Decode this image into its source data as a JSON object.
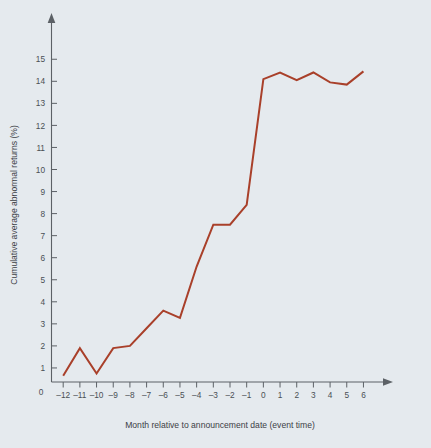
{
  "chart_data": {
    "type": "line",
    "title": "",
    "subtitle": "",
    "xlabel": "Month relative to announcement date (event time)",
    "ylabel": "Cumulative average abnormal returns (%)",
    "x": [
      -12,
      -11,
      -10,
      -9,
      -8,
      -7,
      -6,
      -5,
      -4,
      -3,
      -2,
      -1,
      0,
      1,
      2,
      3,
      4,
      5,
      6
    ],
    "values": [
      0.65,
      1.9,
      0.75,
      1.9,
      2.0,
      2.8,
      3.6,
      3.27,
      5.6,
      7.5,
      7.5,
      8.4,
      14.1,
      14.4,
      14.05,
      14.4,
      13.95,
      13.85,
      14.45
    ],
    "series": [
      {
        "name": "Cumulative average abnormal returns",
        "values": [
          0.65,
          1.9,
          0.75,
          1.9,
          2.0,
          2.8,
          3.6,
          3.27,
          5.6,
          7.5,
          7.5,
          8.4,
          14.1,
          14.4,
          14.05,
          14.4,
          13.95,
          13.85,
          14.45
        ],
        "color": "#a9402a"
      }
    ],
    "xtick_labels": [
      "–12",
      "–11",
      "–10",
      "–9",
      "–8",
      "–7",
      "–6",
      "–5",
      "–4",
      "–3",
      "–2",
      "–1",
      "0",
      "1",
      "2",
      "3",
      "4",
      "5",
      "6"
    ],
    "ytick_labels": [
      "1",
      "2",
      "3",
      "4",
      "5",
      "6",
      "7",
      "8",
      "9",
      "10",
      "11",
      "12",
      "13",
      "14",
      "15"
    ],
    "ytick_values": [
      1,
      2,
      3,
      4,
      5,
      6,
      7,
      8,
      9,
      10,
      11,
      12,
      13,
      14,
      15
    ],
    "origin_label": "0",
    "xlim": [
      -12,
      6
    ],
    "ylim": [
      0,
      15.6
    ],
    "grid": false,
    "legend": false,
    "legend_position": "none",
    "line_color": "#a9402a",
    "background_color": "#e5eaee",
    "axis_color": "#5c6166",
    "text_color": "#4a4f54"
  }
}
